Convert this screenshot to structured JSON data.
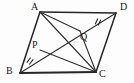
{
  "figure": {
    "kind": "geometry-diagram",
    "shape": "parallelogram",
    "stroke_color": "#262626",
    "background_color": "#fdfdfd",
    "label_color": "#1a1a1a",
    "viewbox": "0 0 134 83",
    "vertices": [
      {
        "name": "A",
        "label": "A",
        "x": 40,
        "y": 12,
        "label_x": 31,
        "label_y": 2
      },
      {
        "name": "D",
        "label": "D",
        "x": 116,
        "y": 13,
        "label_x": 120,
        "label_y": 2
      },
      {
        "name": "B",
        "label": "B",
        "x": 20,
        "y": 73,
        "label_x": 6,
        "label_y": 66
      },
      {
        "name": "C",
        "label": "C",
        "x": 96,
        "y": 72,
        "label_x": 99,
        "label_y": 69
      }
    ],
    "interior_points": [
      {
        "name": "P",
        "label": "P",
        "x": 40,
        "y": 50,
        "label_x": 32,
        "label_y": 40
      },
      {
        "name": "Q",
        "label": "Q",
        "x": 80,
        "y": 31,
        "label_x": 80,
        "label_y": 32
      }
    ],
    "sides": [
      {
        "name": "side-AD",
        "from": "A",
        "to": "D"
      },
      {
        "name": "side-DC",
        "from": "D",
        "to": "C"
      },
      {
        "name": "side-CB",
        "from": "C",
        "to": "B"
      },
      {
        "name": "side-BA",
        "from": "B",
        "to": "A"
      }
    ],
    "diagonals": [
      {
        "name": "diagonal-AC",
        "from": "A",
        "to": "C"
      },
      {
        "name": "diagonal-BD",
        "from": "B",
        "to": "D"
      }
    ],
    "cevians": [
      {
        "name": "segment-AQ",
        "from": "A",
        "to": "Q"
      },
      {
        "name": "segment-CP",
        "from": "C",
        "to": "P"
      },
      {
        "name": "segment-CQ",
        "from": "C",
        "to": "Q"
      }
    ],
    "tick_marks": [
      {
        "name": "tick-BP",
        "on_segment": "BP",
        "x": 30,
        "y": 61,
        "angle": 38,
        "count": 2
      },
      {
        "name": "tick-QD",
        "on_segment": "QD",
        "x": 98,
        "y": 22,
        "angle": 25,
        "count": 2
      }
    ],
    "caption": ""
  }
}
